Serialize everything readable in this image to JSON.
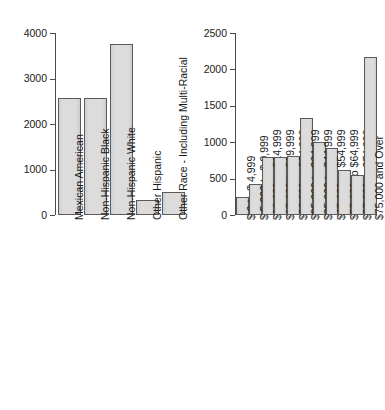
{
  "figure": {
    "background_color": "#ffffff",
    "bar_fill_color": "#d9d9d9",
    "bar_border_color": "#5a5a5a",
    "axis_color": "#4a4a4a",
    "text_color": "#1a1a1a"
  },
  "chart_data": [
    {
      "type": "bar",
      "title": "",
      "xlabel": "",
      "ylabel": "",
      "ylim": [
        0,
        4000
      ],
      "yticks": [
        0,
        1000,
        2000,
        3000,
        4000
      ],
      "ytick_labels": [
        "0",
        "1000",
        "2000",
        "3000",
        "4000"
      ],
      "grid": false,
      "legend": "none",
      "categories": [
        "Mexican American",
        "Non-Hispanic Black",
        "Non-Hispanic White",
        "Other Hispanic",
        "Other Race - Including Multi-Racial"
      ],
      "values": [
        2580,
        2580,
        3750,
        320,
        500
      ]
    },
    {
      "type": "bar",
      "title": "",
      "xlabel": "",
      "ylabel": "",
      "ylim": [
        0,
        2500
      ],
      "yticks": [
        0,
        500,
        1000,
        1500,
        2000,
        2500
      ],
      "ytick_labels": [
        "0",
        "500",
        "1000",
        "1500",
        "2000",
        "2500"
      ],
      "grid": false,
      "legend": "none",
      "categories": [
        "$ 0 to $ 4,999",
        "$ 5,000 to $ 9,999",
        "$10,000 to $14,999",
        "$15,000 to $19,999",
        "$20,000 to $24,999",
        "$25,000 to $34,999",
        "$35,000 to $44,999",
        "$45,000 to $54,999",
        "$55,000 to $64,999",
        "$65,000 to $74,999",
        "$75,000 and Over"
      ],
      "values": [
        250,
        430,
        800,
        800,
        815,
        1330,
        1000,
        920,
        615,
        550,
        2170
      ]
    }
  ]
}
